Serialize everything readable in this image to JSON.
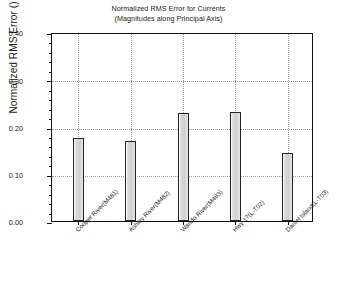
{
  "chart_data": {
    "type": "bar",
    "title": "Normalized RMS Error for Currents",
    "subtitle": "(Magnitudes along Principal Axis)",
    "xlabel": "",
    "ylabel": "Normalized RMS Error ()",
    "ylim": [
      0.0,
      0.4
    ],
    "ytick_labels": [
      "0.40",
      "0.30",
      "0.20",
      "0.10",
      "0.00"
    ],
    "ytick_values": [
      0.4,
      0.3,
      0.2,
      0.1,
      0.0
    ],
    "ytick_minor_step": 0.02,
    "grid": "horizontal-and-vertical-dotted",
    "legend": "none",
    "categories": [
      "Cooper River(M481)",
      "Ashley River(M482)",
      "Wando River(M483)",
      "Hwy 17(L-T02)",
      "Daniel Island(L-T03)"
    ],
    "values": [
      0.176,
      0.169,
      0.228,
      0.231,
      0.144
    ],
    "bar_fill_color": "#d4d4d4",
    "bar_edge_color": "#232323",
    "axis_color": "#111111",
    "grid_color": "#9a9a9a",
    "background_color": "#ffffff"
  }
}
